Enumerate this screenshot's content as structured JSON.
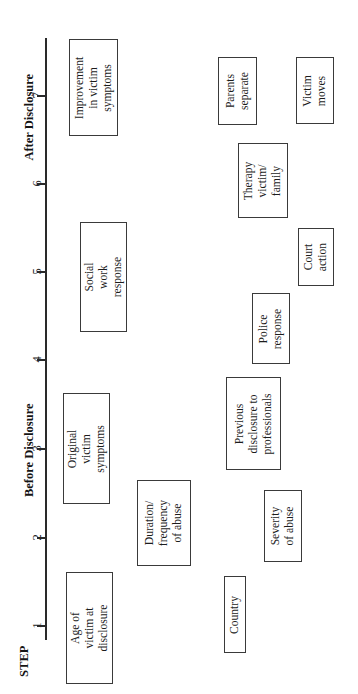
{
  "figure": {
    "orientation": "rotated-90-ccw",
    "axis": {
      "step_label": "STEP",
      "ticks": [
        "1",
        "2",
        "3",
        "4",
        "5",
        "6",
        "7"
      ],
      "phase_labels": {
        "before": "Before Disclosure",
        "after": "After Disclosure"
      }
    },
    "nodes": [
      {
        "id": "age-of-victim",
        "text": "Age of\nvictim at\ndisclosure",
        "step": "1",
        "row": 1
      },
      {
        "id": "original-symptoms",
        "text": "Original\nvictim\nsymptoms",
        "step": "3",
        "row": 1
      },
      {
        "id": "social-work-response",
        "text": "Social\nwork\nresponse",
        "step": "5",
        "row": 1
      },
      {
        "id": "improvement-symptoms",
        "text": "Improvement\nin victim\nsymptoms",
        "step": "7",
        "row": 1
      },
      {
        "id": "duration-frequency",
        "text": "Duration/\nfrequency\nof abuse",
        "step": "2",
        "row": 2
      },
      {
        "id": "country",
        "text": "Country",
        "step": "1",
        "row": 3
      },
      {
        "id": "severity-of-abuse",
        "text": "Severity\nof abuse",
        "step": "2",
        "row": 3
      },
      {
        "id": "previous-disclosure",
        "text": "Previous\ndisclosure to\nprofessionals",
        "step": "3",
        "row": 3
      },
      {
        "id": "police-response",
        "text": "Police\nresponse",
        "step": "4",
        "row": 3
      },
      {
        "id": "therapy-victim-family",
        "text": "Therapy\nvictim/\nfamily",
        "step": "6",
        "row": 3
      },
      {
        "id": "parents-separate",
        "text": "Parents\nseparate",
        "step": "7",
        "row": 3
      },
      {
        "id": "court-action",
        "text": "Court\naction",
        "step": "5",
        "row": 4
      },
      {
        "id": "victim-moves",
        "text": "Victim\nmoves",
        "step": "7",
        "row": 4
      }
    ]
  },
  "colors": {
    "background": "#ffffff",
    "ink": "#1c1c1c",
    "box_border": "#3a3a3a",
    "axis": "#2a2a2a"
  }
}
